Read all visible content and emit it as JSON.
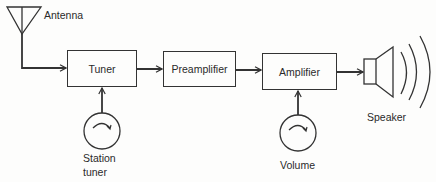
{
  "diagram": {
    "antenna": {
      "label": "Antenna"
    },
    "blocks": [
      {
        "id": "tuner",
        "label": "Tuner"
      },
      {
        "id": "preamplifier",
        "label": "Preamplifier"
      },
      {
        "id": "amplifier",
        "label": "Amplifier"
      }
    ],
    "controls": [
      {
        "id": "station-tuner",
        "label_line1": "Station",
        "label_line2": "tuner",
        "attached_to": "tuner"
      },
      {
        "id": "volume",
        "label_line1": "Volume",
        "attached_to": "amplifier"
      }
    ],
    "output": {
      "label": "Speaker"
    },
    "connections": [
      {
        "from": "antenna",
        "to": "tuner"
      },
      {
        "from": "tuner",
        "to": "preamplifier"
      },
      {
        "from": "preamplifier",
        "to": "amplifier"
      },
      {
        "from": "amplifier",
        "to": "speaker"
      },
      {
        "from": "station-tuner",
        "to": "tuner"
      },
      {
        "from": "volume",
        "to": "amplifier"
      }
    ],
    "colors": {
      "line": "#333333",
      "background": "#fdfdfc"
    }
  }
}
